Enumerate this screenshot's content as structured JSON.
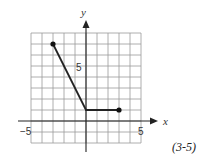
{
  "chart_data": {
    "type": "line",
    "title": "",
    "xlabel": "x",
    "ylabel": "y",
    "xlim": [
      -5,
      5
    ],
    "ylim": [
      -2,
      8
    ],
    "grid": true,
    "x_tick_labels": [
      "-5",
      "5"
    ],
    "y_tick_labels": [
      "5"
    ],
    "series": [
      {
        "name": "piecewise",
        "points": [
          [
            -3,
            7
          ],
          [
            0,
            1
          ],
          [
            3,
            1
          ]
        ],
        "endpoints_closed": [
          [
            -3,
            7
          ],
          [
            3,
            1
          ]
        ]
      }
    ]
  },
  "labels": {
    "x_axis": "x",
    "y_axis": "y",
    "x_min_tick": "−5",
    "x_max_tick": "5",
    "y_tick": "5",
    "caption": "(3-5)"
  }
}
